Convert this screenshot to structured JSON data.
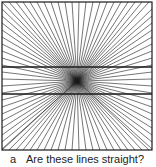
{
  "figure": {
    "center": [
      77,
      81
    ],
    "border": {
      "x": 2,
      "y": 2,
      "w": 150,
      "h": 148
    },
    "horizontal_lines_y": [
      67,
      94
    ],
    "ray_spacing": 7,
    "stroke_color": "#1a1a1a"
  },
  "caption": {
    "label": "a",
    "text": "Are these lines straight?"
  }
}
